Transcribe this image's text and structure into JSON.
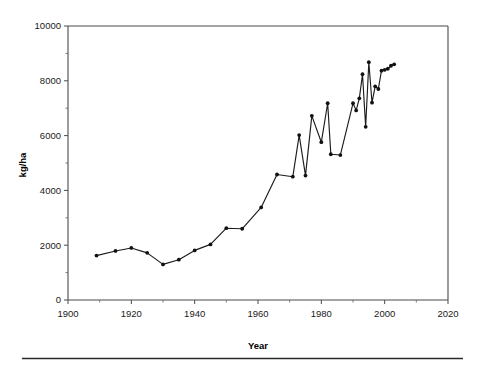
{
  "figure": {
    "background_color": "#ffffff",
    "line_color": "#1c1c1c",
    "axis_color": "#4a4a4a",
    "footer_rule_color": "#2b2b2b"
  },
  "chart_data": {
    "type": "line",
    "title": "",
    "subtitle": "",
    "xlabel": "Year",
    "ylabel": "kg/ha",
    "xlim": [
      1900,
      2020
    ],
    "ylim": [
      0,
      10000
    ],
    "x_major_ticks": [
      1900,
      1920,
      1940,
      1960,
      1980,
      2000,
      2020
    ],
    "x_major_tick_labels": [
      "1900",
      "1920",
      "1940",
      "1960",
      "1980",
      "2000",
      "2020"
    ],
    "x_minor_ticks": [
      1910,
      1930,
      1950,
      1970,
      1990,
      2010
    ],
    "y_major_ticks": [
      0,
      2000,
      4000,
      6000,
      8000,
      10000
    ],
    "y_major_tick_labels": [
      "0",
      "2000",
      "4000",
      "6000",
      "8000",
      "10000"
    ],
    "y_minor_ticks": [
      1000,
      3000,
      5000,
      7000,
      9000
    ],
    "grid": false,
    "legend": false,
    "legend_position": "none",
    "markers": "filled-circle",
    "series": [
      {
        "name": "Yield",
        "x": [
          1909,
          1915,
          1920,
          1925,
          1930,
          1935,
          1940,
          1945,
          1950,
          1955,
          1961,
          1966,
          1971,
          1973,
          1975,
          1977,
          1980,
          1982,
          1983,
          1986,
          1990,
          1991,
          1992,
          1993,
          1994,
          1995,
          1996,
          1997,
          1998,
          1999,
          2000,
          2001,
          2002,
          2003
        ],
        "values": [
          1620,
          1790,
          1900,
          1720,
          1300,
          1470,
          1810,
          2030,
          2620,
          2600,
          3380,
          4580,
          4500,
          6020,
          4540,
          6720,
          5760,
          7180,
          5320,
          5290,
          7180,
          6920,
          7360,
          8240,
          6320,
          8680,
          7200,
          7800,
          7700,
          8370,
          8400,
          8440,
          8550,
          8600
        ]
      }
    ]
  }
}
